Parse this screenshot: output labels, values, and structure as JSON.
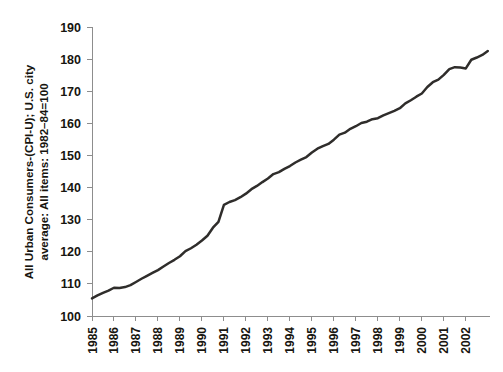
{
  "chart_data": {
    "type": "line",
    "title": "",
    "xlabel": "",
    "ylabel": "All Urban Consumers-(CPI-U); U.S. city average: All items: 1982–84=100",
    "ylabel_line1": "All Urban Consumers-(CPI-U); U.S. city",
    "ylabel_line2": "average: All items: 1982–84=100",
    "ylim": [
      100,
      190
    ],
    "yticks": [
      100,
      110,
      120,
      130,
      140,
      150,
      160,
      170,
      180,
      190
    ],
    "ytick_labels": [
      "100",
      "110",
      "120",
      "130",
      "140",
      "150",
      "160",
      "170",
      "180",
      "190"
    ],
    "xlim": [
      1985,
      2003.1
    ],
    "xticks": [
      1985,
      1986,
      1987,
      1988,
      1989,
      1990,
      1991,
      1992,
      1993,
      1994,
      1995,
      1996,
      1997,
      1998,
      1999,
      2000,
      2001,
      2002
    ],
    "xtick_labels": [
      "1985",
      "1986",
      "1987",
      "1988",
      "1989",
      "1990",
      "1991",
      "1992",
      "1993",
      "1994",
      "1995",
      "1996",
      "1997",
      "1998",
      "1999",
      "2000",
      "2001",
      "2002"
    ],
    "grid": false,
    "legend": false,
    "line_color": "#2f2d2b",
    "axis_color": "#8d8d8d",
    "series": [
      {
        "name": "CPI-U, U.S. city average, all items",
        "x": [
          1985.0,
          1985.25,
          1985.5,
          1985.75,
          1986.0,
          1986.25,
          1986.5,
          1986.75,
          1987.0,
          1987.25,
          1987.5,
          1987.75,
          1988.0,
          1988.25,
          1988.5,
          1988.75,
          1989.0,
          1989.25,
          1989.5,
          1989.75,
          1990.0,
          1990.25,
          1990.5,
          1990.75,
          1991.0,
          1991.25,
          1991.5,
          1991.75,
          1992.0,
          1992.25,
          1992.5,
          1992.75,
          1993.0,
          1993.25,
          1993.5,
          1993.75,
          1994.0,
          1994.25,
          1994.5,
          1994.75,
          1995.0,
          1995.25,
          1995.5,
          1995.75,
          1996.0,
          1996.25,
          1996.5,
          1996.75,
          1997.0,
          1997.25,
          1997.5,
          1997.75,
          1998.0,
          1998.25,
          1998.5,
          1998.75,
          1999.0,
          1999.25,
          1999.5,
          1999.75,
          2000.0,
          2000.25,
          2000.5,
          2000.75,
          2001.0,
          2001.25,
          2001.5,
          2001.75,
          2002.0,
          2002.25,
          2002.5,
          2002.75,
          2003.0
        ],
        "values": [
          105.5,
          106.4,
          107.2,
          107.9,
          108.8,
          108.7,
          109.0,
          109.6,
          110.6,
          111.6,
          112.5,
          113.4,
          114.3,
          115.4,
          116.5,
          117.5,
          118.6,
          120.2,
          121.1,
          122.2,
          123.5,
          125.0,
          127.5,
          129.3,
          134.6,
          135.5,
          136.1,
          137.0,
          138.1,
          139.5,
          140.5,
          141.7,
          142.8,
          144.2,
          144.8,
          145.8,
          146.7,
          147.8,
          148.7,
          149.5,
          150.9,
          152.1,
          152.9,
          153.6,
          154.9,
          156.5,
          157.1,
          158.3,
          159.1,
          160.1,
          160.5,
          161.3,
          161.6,
          162.5,
          163.2,
          163.9,
          164.7,
          166.2,
          167.2,
          168.3,
          169.3,
          171.3,
          172.8,
          173.6,
          175.1,
          176.9,
          177.5,
          177.4,
          177.1,
          179.8,
          180.5,
          181.3,
          182.5
        ]
      }
    ],
    "annotations": [
      {
        "text": "dip in 1986",
        "x": 1986.25,
        "value": 108.7
      },
      {
        "text": "plateau 2001-2002",
        "x": 2001.75,
        "value": 177.4
      }
    ]
  }
}
